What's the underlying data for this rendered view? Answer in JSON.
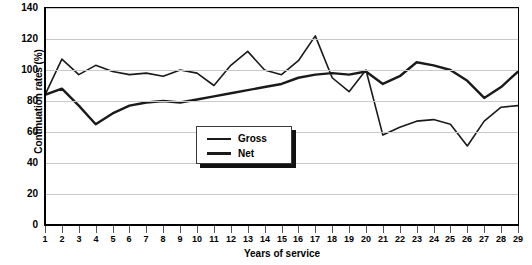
{
  "chart_data": {
    "type": "line",
    "title": "",
    "xlabel": "Years of service",
    "ylabel": "Continuation rates (%)",
    "xlim": [
      1,
      29
    ],
    "ylim": [
      0,
      140
    ],
    "ytick_step": 20,
    "yticks": [
      140,
      120,
      100,
      80,
      60,
      40,
      20,
      0
    ],
    "grid": true,
    "legend_position": "center",
    "x": [
      1,
      2,
      3,
      4,
      5,
      6,
      7,
      8,
      9,
      10,
      11,
      12,
      13,
      14,
      15,
      16,
      17,
      18,
      19,
      20,
      21,
      22,
      23,
      24,
      25,
      26,
      27,
      28,
      29
    ],
    "categories": [
      "1",
      "2",
      "3",
      "4",
      "5",
      "6",
      "7",
      "8",
      "9",
      "10",
      "11",
      "12",
      "13",
      "14",
      "15",
      "16",
      "17",
      "18",
      "19",
      "20",
      "21",
      "22",
      "23",
      "24",
      "25",
      "26",
      "27",
      "28",
      "29"
    ],
    "series": [
      {
        "name": "Gross",
        "values": [
          84,
          107,
          97,
          103,
          99,
          97,
          98,
          96,
          100,
          98,
          90,
          103,
          112,
          100,
          97,
          106,
          122,
          95,
          86,
          100,
          58,
          63,
          67,
          68,
          65,
          51,
          67,
          76,
          77
        ]
      },
      {
        "name": "Net",
        "values": [
          84,
          88,
          77,
          65,
          72,
          77,
          79,
          80,
          79,
          81,
          83,
          85,
          87,
          89,
          91,
          95,
          97,
          98,
          97,
          99,
          91,
          96,
          105,
          103,
          100,
          93,
          82,
          89,
          99
        ]
      }
    ],
    "legend_entries": [
      {
        "label": "Gross",
        "style": "thin"
      },
      {
        "label": "Net",
        "style": "thick"
      }
    ],
    "colors": {
      "line": "#1a1a1a",
      "grid": "#c9c9c9",
      "axis": "#000000",
      "background": "#ffffff"
    }
  }
}
